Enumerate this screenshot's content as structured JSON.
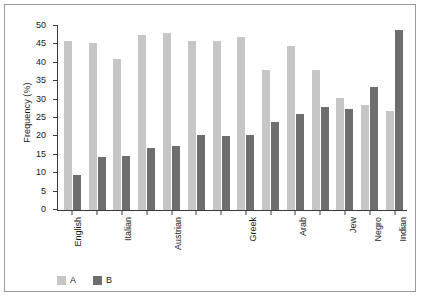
{
  "chart_data": {
    "type": "bar",
    "title": "",
    "xlabel": "",
    "ylabel": "Frequency (%)",
    "ylim": [
      0,
      50
    ],
    "yticks": [
      0,
      5,
      10,
      15,
      20,
      25,
      30,
      35,
      40,
      45,
      50
    ],
    "grid": false,
    "legend_position": "bottom-left",
    "categories": [
      "English",
      "",
      "Italian",
      "",
      "Austrian",
      "",
      "",
      "Greek",
      "",
      "Arab",
      "",
      "Jew",
      "Negro",
      "Indian"
    ],
    "series": [
      {
        "name": "A",
        "color": "#c6c6c6",
        "values": [
          46,
          45.5,
          41,
          47.5,
          48,
          46,
          45.8,
          47,
          38,
          44.5,
          38,
          30.5,
          28.5,
          27
        ]
      },
      {
        "name": "B",
        "color": "#6e6e6e",
        "values": [
          9.5,
          14.3,
          14.8,
          16.8,
          17.5,
          20.5,
          20,
          20.5,
          24,
          26,
          28,
          27.5,
          33.5,
          49
        ]
      }
    ],
    "legend": [
      {
        "label": "A",
        "color": "#c6c6c6"
      },
      {
        "label": "B",
        "color": "#6e6e6e"
      }
    ]
  },
  "colors": {
    "series_a": "#c6c6c6",
    "series_b": "#6e6e6e",
    "axis": "#3a3a3a",
    "frame": "#9a9a9a",
    "background": "#ffffff",
    "text": "#1a1a1a"
  }
}
